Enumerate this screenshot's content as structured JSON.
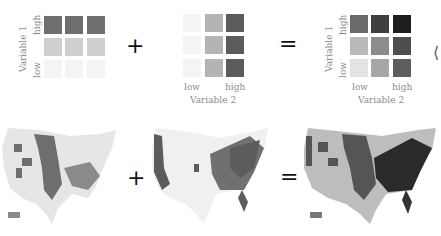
{
  "legend_left": {
    "y_axis_label": "Variable 1",
    "y_high": "high",
    "y_low": "low",
    "rows": [
      [
        "#6e6e6e",
        "#6e6e6e",
        "#6e6e6e"
      ],
      [
        "#cfcfcf",
        "#cfcfcf",
        "#cfcfcf"
      ],
      [
        "#f4f4f4",
        "#f4f4f4",
        "#f4f4f4"
      ]
    ]
  },
  "legend_middle": {
    "x_axis_label": "Variable 2",
    "x_low": "low",
    "x_high": "high",
    "rows": [
      [
        "#f4f4f4",
        "#b4b4b4",
        "#5c5c5c"
      ],
      [
        "#f4f4f4",
        "#b4b4b4",
        "#5c5c5c"
      ],
      [
        "#f4f4f4",
        "#b4b4b4",
        "#5c5c5c"
      ]
    ]
  },
  "legend_right": {
    "y_axis_label": "Variable 1",
    "y_high": "high",
    "y_low": "low",
    "x_axis_label": "Variable 2",
    "x_low": "low",
    "x_high": "high",
    "rows": [
      [
        "#6a6a6a",
        "#3e3e3e",
        "#1e1e1e"
      ],
      [
        "#b9b9b9",
        "#8c8c8c",
        "#4e4e4e"
      ],
      [
        "#e3e3e3",
        "#a6a6a6",
        "#5e5e5e"
      ]
    ]
  },
  "operators": {
    "plus": "+",
    "equals": "=",
    "angle": "⟨"
  },
  "maps": [
    {
      "name": "variable-1-map",
      "base": "#e6e6e6",
      "dark": "#6e6e6e"
    },
    {
      "name": "variable-2-map",
      "base": "#f0f0f0",
      "dark": "#5c5c5c"
    },
    {
      "name": "bivariate-map",
      "base": "#bdbdbd",
      "dark": "#2a2a2a"
    }
  ]
}
